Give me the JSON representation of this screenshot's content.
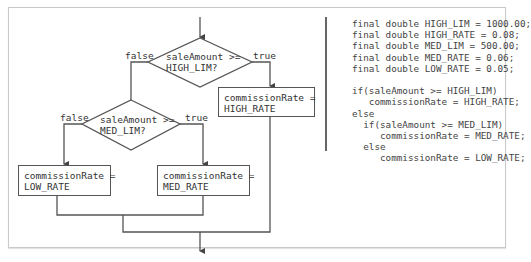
{
  "flowchart": {
    "decision_high": {
      "line1": "saleAmount >=",
      "line2": "HIGH_LIM?"
    },
    "decision_med": {
      "line1": "saleAmount >=",
      "line2": "MED_LIM?"
    },
    "labels": {
      "high_false": "false",
      "high_true": "true",
      "med_false": "false",
      "med_true": "true"
    },
    "box_high": {
      "line1": "commissionRate =",
      "line2": "HIGH_RATE"
    },
    "box_med": {
      "line1": "commissionRate =",
      "line2": "MED_RATE"
    },
    "box_low": {
      "line1": "commissionRate =",
      "line2": "LOW_RATE"
    }
  },
  "code": {
    "lines": [
      "final double HIGH_LIM = 1000.00;",
      "final double HIGH_RATE = 0.08;",
      "final double MED_LIM = 500.00;",
      "final double MED_RATE = 0.06;",
      "final double LOW_RATE = 0.05;",
      "",
      "if(saleAmount >= HIGH_LIM)",
      "   commissionRate = HIGH_RATE;",
      "else",
      "  if(saleAmount >= MED_LIM)",
      "     commissionRate = MED_RATE;",
      "  else",
      "     commissionRate = LOW_RATE;"
    ]
  },
  "colors": {
    "line": "#555555",
    "text": "#333333",
    "frame": "#c9c9c9"
  }
}
